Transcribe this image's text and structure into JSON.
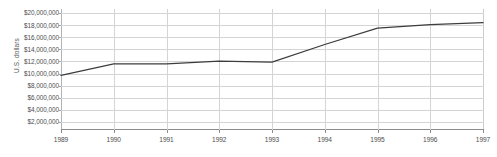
{
  "chart_data": {
    "type": "line",
    "title": "",
    "xlabel": "",
    "ylabel": "U.S. dollars",
    "x": [
      1989,
      1990,
      1991,
      1992,
      1993,
      1994,
      1995,
      1996,
      1997
    ],
    "x_tick_labels": [
      "1989",
      "1990",
      "1991",
      "1992",
      "1993",
      "1994",
      "1995",
      "1996",
      "1997"
    ],
    "values": [
      9700000,
      11600000,
      11600000,
      12050000,
      11900000,
      14800000,
      17500000,
      18100000,
      18400000
    ],
    "series": [
      {
        "name": "U.S. dollars",
        "values": [
          9700000,
          11600000,
          11600000,
          12050000,
          11900000,
          14800000,
          17500000,
          18100000,
          18400000
        ]
      }
    ],
    "y_tick_labels": [
      "$20,000,000",
      "$18,000,000",
      "$16,000,000",
      "$14,000,000",
      "$12,000,000",
      "$10,000,000",
      "$8,000,000",
      "$6,000,000",
      "$4,000,000",
      "$2,000,000"
    ],
    "y_tick_values": [
      20000000,
      18000000,
      16000000,
      14000000,
      12000000,
      10000000,
      8000000,
      6000000,
      4000000,
      2000000
    ],
    "ylim": [
      666667,
      20666667
    ],
    "xlim": [
      1989,
      1997
    ],
    "grid": true,
    "legend": "none",
    "line_color": "#3d3d3d",
    "gridline_color": "#d4d4d4",
    "axis_color": "#8c8c8c",
    "text_color": "#4d4d4d",
    "background_color": "#ffffff"
  }
}
